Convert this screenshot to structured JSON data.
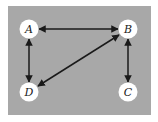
{
  "diagram": {
    "type": "directed-graph",
    "background_color": "#ffffff",
    "panel_color": "#a8a8a8",
    "node_fill": "#ffffff",
    "edge_color": "#1a1a1a",
    "nodes": [
      {
        "id": "A",
        "label": "A",
        "x": 29,
        "y": 29
      },
      {
        "id": "B",
        "label": "B",
        "x": 128,
        "y": 29
      },
      {
        "id": "C",
        "label": "C",
        "x": 128,
        "y": 92
      },
      {
        "id": "D",
        "label": "D",
        "x": 29,
        "y": 92
      }
    ],
    "edges": [
      {
        "from": "A",
        "to": "B",
        "bidirectional": true
      },
      {
        "from": "A",
        "to": "D",
        "bidirectional": true
      },
      {
        "from": "B",
        "to": "D",
        "bidirectional": true
      },
      {
        "from": "B",
        "to": "C",
        "bidirectional": true
      }
    ]
  }
}
